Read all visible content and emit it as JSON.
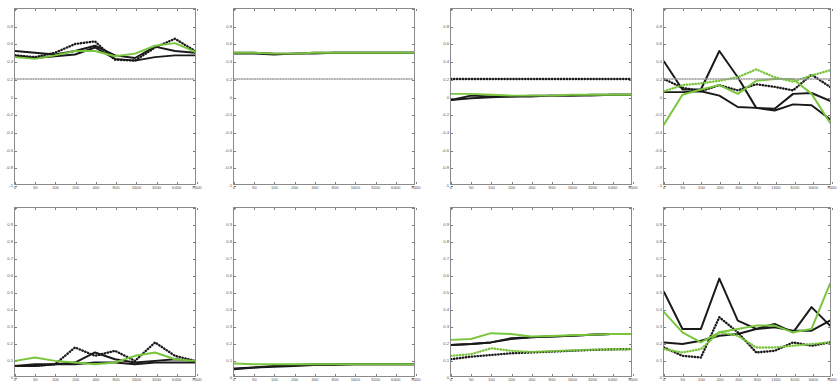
{
  "figure": {
    "type": "multi-panel-line-grid",
    "rows": 2,
    "cols": 4,
    "background": "#ffffff",
    "axis_color": "#8a8a8a",
    "colors": {
      "black": "#1a1a1a",
      "green": "#79c63c",
      "grey_dot": "#9a9a9a"
    }
  },
  "chart_data": [
    {
      "type": "line",
      "panel": "r1c1",
      "title": "",
      "xlabel": "",
      "ylabel": "",
      "xlim": [
        0,
        9
      ],
      "ylim": [
        -1,
        1
      ],
      "grid": false,
      "legend": "none",
      "x": [
        0,
        1,
        2,
        3,
        4,
        5,
        6,
        7,
        8,
        9
      ],
      "xticklabels": [
        "0",
        "50",
        "100",
        "200",
        "400",
        "800",
        "1600",
        "3200",
        "6400",
        "9600"
      ],
      "yticklabels": [
        "1",
        "0.8",
        "0.6",
        "0.4",
        "0.2",
        "0",
        "-0.2",
        "-0.4",
        "-0.6",
        "-0.8",
        "-1"
      ],
      "series": [
        {
          "name": "black-solid-a",
          "color": "#1a1a1a",
          "style": "solid",
          "values": [
            0.52,
            0.5,
            0.48,
            0.52,
            0.58,
            0.47,
            0.44,
            0.57,
            0.52,
            0.5
          ]
        },
        {
          "name": "black-solid-b",
          "color": "#1a1a1a",
          "style": "solid",
          "values": [
            0.47,
            0.44,
            0.46,
            0.48,
            0.56,
            0.43,
            0.41,
            0.45,
            0.47,
            0.47
          ]
        },
        {
          "name": "black-dotted",
          "color": "#1a1a1a",
          "style": "dotted",
          "values": [
            0.47,
            0.45,
            0.5,
            0.6,
            0.63,
            0.42,
            0.41,
            0.56,
            0.66,
            0.52
          ]
        },
        {
          "name": "green-solid",
          "color": "#79c63c",
          "style": "solid",
          "values": [
            0.45,
            0.43,
            0.47,
            0.52,
            0.52,
            0.46,
            0.49,
            0.58,
            0.61,
            0.51
          ]
        },
        {
          "name": "grey-dotted-baseline",
          "color": "#9a9a9a",
          "style": "dotted",
          "values": [
            0.2,
            0.2,
            0.2,
            0.2,
            0.2,
            0.2,
            0.2,
            0.2,
            0.2,
            0.2
          ]
        }
      ]
    },
    {
      "type": "line",
      "panel": "r1c2",
      "title": "",
      "xlabel": "",
      "ylabel": "",
      "xlim": [
        0,
        9
      ],
      "ylim": [
        -1,
        1
      ],
      "grid": false,
      "legend": "none",
      "x": [
        0,
        1,
        2,
        3,
        4,
        5,
        6,
        7,
        8,
        9
      ],
      "xticklabels": [
        "0",
        "50",
        "100",
        "200",
        "400",
        "800",
        "1600",
        "3200",
        "6400",
        "9600"
      ],
      "yticklabels": [
        "1",
        "0.8",
        "0.6",
        "0.4",
        "0.2",
        "0",
        "-0.2",
        "-0.4",
        "-0.6",
        "-0.8",
        "-1"
      ],
      "series": [
        {
          "name": "black-solid-a",
          "color": "#1a1a1a",
          "style": "solid",
          "values": [
            0.5,
            0.5,
            0.49,
            0.49,
            0.5,
            0.5,
            0.5,
            0.5,
            0.5,
            0.5
          ]
        },
        {
          "name": "black-solid-b",
          "color": "#1a1a1a",
          "style": "solid",
          "values": [
            0.49,
            0.49,
            0.48,
            0.49,
            0.49,
            0.5,
            0.5,
            0.5,
            0.5,
            0.5
          ]
        },
        {
          "name": "green-solid",
          "color": "#79c63c",
          "style": "solid",
          "values": [
            0.5,
            0.5,
            0.49,
            0.49,
            0.5,
            0.5,
            0.5,
            0.5,
            0.5,
            0.5
          ]
        },
        {
          "name": "grey-dotted-baseline",
          "color": "#9a9a9a",
          "style": "dotted",
          "values": [
            0.2,
            0.2,
            0.2,
            0.2,
            0.2,
            0.2,
            0.2,
            0.2,
            0.2,
            0.2
          ]
        }
      ]
    },
    {
      "type": "line",
      "panel": "r1c3",
      "title": "",
      "xlabel": "",
      "ylabel": "",
      "xlim": [
        0,
        9
      ],
      "ylim": [
        -1,
        1
      ],
      "grid": false,
      "legend": "none",
      "x": [
        0,
        1,
        2,
        3,
        4,
        5,
        6,
        7,
        8,
        9
      ],
      "xticklabels": [
        "0",
        "50",
        "100",
        "200",
        "400",
        "800",
        "1600",
        "3200",
        "6400",
        "9600"
      ],
      "yticklabels": [
        "1",
        "0.8",
        "0.6",
        "0.4",
        "0.2",
        "0",
        "-0.2",
        "-0.4",
        "-0.6",
        "-0.8",
        "-1"
      ],
      "series": [
        {
          "name": "black-solid-a",
          "color": "#1a1a1a",
          "style": "solid",
          "values": [
            -0.04,
            0.01,
            0.0,
            0.0,
            0.01,
            0.01,
            0.01,
            0.02,
            0.02,
            0.02
          ]
        },
        {
          "name": "black-solid-b",
          "color": "#1a1a1a",
          "style": "solid",
          "values": [
            -0.04,
            -0.02,
            -0.01,
            0.0,
            0.0,
            0.01,
            0.01,
            0.01,
            0.02,
            0.02
          ]
        },
        {
          "name": "black-dotted",
          "color": "#1a1a1a",
          "style": "dotted",
          "values": [
            0.2,
            0.2,
            0.2,
            0.2,
            0.2,
            0.2,
            0.2,
            0.2,
            0.2,
            0.2
          ]
        },
        {
          "name": "green-solid",
          "color": "#79c63c",
          "style": "solid",
          "values": [
            0.03,
            0.03,
            0.02,
            0.01,
            0.01,
            0.01,
            0.02,
            0.02,
            0.02,
            0.02
          ]
        }
      ]
    },
    {
      "type": "line",
      "panel": "r1c4",
      "title": "",
      "xlabel": "",
      "ylabel": "",
      "xlim": [
        0,
        9
      ],
      "ylim": [
        -1,
        1
      ],
      "grid": false,
      "legend": "none",
      "x": [
        0,
        1,
        2,
        3,
        4,
        5,
        6,
        7,
        8,
        9
      ],
      "xticklabels": [
        "0",
        "50",
        "100",
        "200",
        "400",
        "800",
        "1600",
        "3200",
        "6400",
        "9600"
      ],
      "yticklabels": [
        "1",
        "0.8",
        "0.6",
        "0.4",
        "0.2",
        "0",
        "-0.2",
        "-0.4",
        "-0.6",
        "-0.8",
        "-1"
      ],
      "series": [
        {
          "name": "black-solid-a",
          "color": "#1a1a1a",
          "style": "solid",
          "values": [
            0.4,
            0.08,
            0.08,
            0.52,
            0.22,
            -0.13,
            -0.14,
            0.03,
            0.04,
            -0.05
          ]
        },
        {
          "name": "black-solid-b",
          "color": "#1a1a1a",
          "style": "solid",
          "values": [
            0.05,
            0.05,
            0.06,
            0.01,
            -0.12,
            -0.13,
            -0.16,
            -0.09,
            -0.1,
            -0.26
          ]
        },
        {
          "name": "black-dotted",
          "color": "#1a1a1a",
          "style": "dotted",
          "values": [
            0.2,
            0.1,
            0.06,
            0.13,
            0.07,
            0.14,
            0.11,
            0.07,
            0.25,
            0.11
          ]
        },
        {
          "name": "green-solid",
          "color": "#79c63c",
          "style": "solid",
          "values": [
            -0.32,
            0.02,
            0.08,
            0.13,
            0.03,
            0.18,
            0.2,
            0.2,
            0.03,
            -0.3
          ]
        },
        {
          "name": "green-dotted",
          "color": "#79c63c",
          "style": "dotted",
          "values": [
            0.06,
            0.13,
            0.15,
            0.18,
            0.22,
            0.31,
            0.22,
            0.17,
            0.24,
            0.3
          ]
        },
        {
          "name": "grey-dotted-baseline",
          "color": "#9a9a9a",
          "style": "dotted",
          "values": [
            0.2,
            0.2,
            0.2,
            0.2,
            0.2,
            0.2,
            0.2,
            0.2,
            0.2,
            0.2
          ]
        }
      ]
    },
    {
      "type": "line",
      "panel": "r2c1",
      "title": "",
      "xlabel": "",
      "ylabel": "",
      "xlim": [
        0,
        9
      ],
      "ylim": [
        0,
        1
      ],
      "grid": false,
      "legend": "none",
      "x": [
        0,
        1,
        2,
        3,
        4,
        5,
        6,
        7,
        8,
        9
      ],
      "xticklabels": [
        "0",
        "50",
        "100",
        "200",
        "400",
        "800",
        "1600",
        "3200",
        "6400",
        "9600"
      ],
      "yticklabels": [
        "1",
        "0.9",
        "0.8",
        "0.7",
        "0.6",
        "0.5",
        "0.4",
        "0.3",
        "0.2",
        "0.1",
        "0"
      ],
      "series": [
        {
          "name": "black-solid-a",
          "color": "#1a1a1a",
          "style": "solid",
          "values": [
            0.06,
            0.07,
            0.07,
            0.08,
            0.14,
            0.1,
            0.08,
            0.09,
            0.1,
            0.09
          ]
        },
        {
          "name": "black-solid-b",
          "color": "#1a1a1a",
          "style": "solid",
          "values": [
            0.06,
            0.06,
            0.07,
            0.07,
            0.08,
            0.08,
            0.07,
            0.08,
            0.08,
            0.08
          ]
        },
        {
          "name": "black-dotted",
          "color": "#1a1a1a",
          "style": "dotted",
          "values": [
            0.06,
            0.06,
            0.07,
            0.17,
            0.12,
            0.15,
            0.09,
            0.2,
            0.12,
            0.09
          ]
        },
        {
          "name": "green-solid",
          "color": "#79c63c",
          "style": "solid",
          "values": [
            0.09,
            0.11,
            0.09,
            0.08,
            0.07,
            0.08,
            0.12,
            0.14,
            0.1,
            0.09
          ]
        }
      ]
    },
    {
      "type": "line",
      "panel": "r2c2",
      "title": "",
      "xlabel": "",
      "ylabel": "",
      "xlim": [
        0,
        9
      ],
      "ylim": [
        0,
        1
      ],
      "grid": false,
      "legend": "none",
      "x": [
        0,
        1,
        2,
        3,
        4,
        5,
        6,
        7,
        8,
        9
      ],
      "xticklabels": [
        "0",
        "50",
        "100",
        "200",
        "400",
        "800",
        "1600",
        "3200",
        "6400",
        "9600"
      ],
      "yticklabels": [
        "1",
        "0.9",
        "0.8",
        "0.7",
        "0.6",
        "0.5",
        "0.4",
        "0.3",
        "0.2",
        "0.1",
        "0"
      ],
      "series": [
        {
          "name": "black-solid-a",
          "color": "#1a1a1a",
          "style": "solid",
          "values": [
            0.045,
            0.05,
            0.06,
            0.065,
            0.07,
            0.07,
            0.07,
            0.07,
            0.07,
            0.07
          ]
        },
        {
          "name": "black-solid-b",
          "color": "#1a1a1a",
          "style": "solid",
          "values": [
            0.04,
            0.05,
            0.055,
            0.06,
            0.065,
            0.065,
            0.07,
            0.07,
            0.07,
            0.07
          ]
        },
        {
          "name": "green-solid",
          "color": "#79c63c",
          "style": "solid",
          "values": [
            0.075,
            0.07,
            0.07,
            0.07,
            0.07,
            0.07,
            0.07,
            0.07,
            0.07,
            0.07
          ]
        }
      ]
    },
    {
      "type": "line",
      "panel": "r2c3",
      "title": "",
      "xlabel": "",
      "ylabel": "",
      "xlim": [
        0,
        9
      ],
      "ylim": [
        0,
        1
      ],
      "grid": false,
      "legend": "none",
      "x": [
        0,
        1,
        2,
        3,
        4,
        5,
        6,
        7,
        8,
        9
      ],
      "xticklabels": [
        "0",
        "50",
        "100",
        "200",
        "400",
        "800",
        "1600",
        "3200",
        "6400",
        "9600"
      ],
      "yticklabels": [
        "1",
        "0.9",
        "0.8",
        "0.7",
        "0.6",
        "0.5",
        "0.4",
        "0.3",
        "0.2",
        "0.1",
        "0"
      ],
      "series": [
        {
          "name": "black-solid-a",
          "color": "#1a1a1a",
          "style": "solid",
          "values": [
            0.185,
            0.19,
            0.2,
            0.225,
            0.23,
            0.235,
            0.24,
            0.245,
            0.25,
            0.25
          ]
        },
        {
          "name": "black-solid-b",
          "color": "#1a1a1a",
          "style": "solid",
          "values": [
            0.185,
            0.19,
            0.2,
            0.22,
            0.23,
            0.235,
            0.24,
            0.245,
            0.25,
            0.25
          ]
        },
        {
          "name": "black-dotted",
          "color": "#1a1a1a",
          "style": "dotted",
          "values": [
            0.1,
            0.115,
            0.125,
            0.135,
            0.14,
            0.145,
            0.15,
            0.155,
            0.158,
            0.16
          ]
        },
        {
          "name": "green-solid",
          "color": "#79c63c",
          "style": "solid",
          "values": [
            0.215,
            0.22,
            0.255,
            0.25,
            0.235,
            0.238,
            0.242,
            0.246,
            0.25,
            0.25
          ]
        },
        {
          "name": "green-dotted",
          "color": "#79c63c",
          "style": "dotted",
          "values": [
            0.12,
            0.13,
            0.165,
            0.15,
            0.143,
            0.147,
            0.152,
            0.156,
            0.159,
            0.16
          ]
        }
      ]
    },
    {
      "type": "line",
      "panel": "r2c4",
      "title": "",
      "xlabel": "",
      "ylabel": "",
      "xlim": [
        0,
        9
      ],
      "ylim": [
        0,
        1
      ],
      "grid": false,
      "legend": "none",
      "x": [
        0,
        1,
        2,
        3,
        4,
        5,
        6,
        7,
        8,
        9
      ],
      "xticklabels": [
        "0",
        "50",
        "100",
        "200",
        "400",
        "800",
        "1600",
        "3200",
        "6400",
        "9600"
      ],
      "yticklabels": [
        "1",
        "0.9",
        "0.8",
        "0.7",
        "0.6",
        "0.5",
        "0.4",
        "0.3",
        "0.2",
        "0.1",
        "0"
      ],
      "series": [
        {
          "name": "black-solid-a",
          "color": "#1a1a1a",
          "style": "solid",
          "values": [
            0.5,
            0.28,
            0.28,
            0.58,
            0.33,
            0.28,
            0.31,
            0.26,
            0.41,
            0.3
          ]
        },
        {
          "name": "black-solid-b",
          "color": "#1a1a1a",
          "style": "solid",
          "values": [
            0.2,
            0.19,
            0.21,
            0.24,
            0.25,
            0.28,
            0.29,
            0.27,
            0.27,
            0.33
          ]
        },
        {
          "name": "black-dotted",
          "color": "#1a1a1a",
          "style": "dotted",
          "values": [
            0.17,
            0.12,
            0.11,
            0.35,
            0.26,
            0.14,
            0.15,
            0.2,
            0.18,
            0.2
          ]
        },
        {
          "name": "green-solid",
          "color": "#79c63c",
          "style": "solid",
          "values": [
            0.38,
            0.26,
            0.2,
            0.26,
            0.28,
            0.3,
            0.3,
            0.26,
            0.28,
            0.55
          ]
        },
        {
          "name": "green-dotted",
          "color": "#79c63c",
          "style": "dotted",
          "values": [
            0.16,
            0.14,
            0.16,
            0.26,
            0.24,
            0.17,
            0.17,
            0.18,
            0.19,
            0.2
          ]
        }
      ]
    }
  ]
}
